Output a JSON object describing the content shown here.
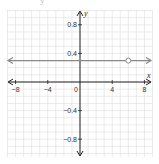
{
  "header": {
    "cut_text": "y"
  },
  "chart_data": {
    "type": "line",
    "title": "",
    "xlabel": "x",
    "ylabel": "y",
    "xlim": [
      -9,
      9
    ],
    "ylim": [
      -1.0,
      1.0
    ],
    "grid": true,
    "x_ticks": [
      -8,
      -4,
      0,
      4,
      8
    ],
    "x_tick_labels": [
      "−8",
      "−4",
      "0",
      "4",
      "8"
    ],
    "y_ticks": [
      0.8,
      0.4,
      -0.4,
      -0.8
    ],
    "y_tick_labels": [
      "0.8",
      "0.4",
      "−0.4",
      "−0.8"
    ],
    "series": [
      {
        "name": "horizontal line",
        "kind": "horizontal_line",
        "y": 0.3,
        "x_range": [
          -9,
          9
        ],
        "arrows": "both",
        "color": "#888888"
      }
    ],
    "annotations": [
      {
        "type": "open_circle",
        "x": 6,
        "y": 0.3
      }
    ],
    "colors": {
      "grid": "#dddddd",
      "axis": "#222222",
      "line": "#888888"
    }
  }
}
